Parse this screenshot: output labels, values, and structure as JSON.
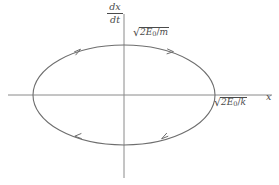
{
  "figure": {
    "name": "phase-space-ellipse-diagram",
    "background_color": "#ffffff",
    "line_color": "#6e6e6e",
    "text_color": "#4a4a4a",
    "width": 279,
    "height": 185
  },
  "axes": {
    "vertical": {
      "label_numerator": "dx",
      "label_denominator": "dt",
      "x_position": 124,
      "y_top": 14,
      "y_bottom": 178
    },
    "horizontal": {
      "label": "x",
      "y_position": 95,
      "x_left": 8,
      "x_right": 272
    }
  },
  "labels": {
    "vertical_intercept": {
      "radical_sign": "√",
      "numerator": "2E",
      "subscript": "0",
      "slash": "/",
      "denominator": "m",
      "full_text": "√(2E₀/m)"
    },
    "horizontal_intercept": {
      "radical_sign": "√",
      "numerator": "2E",
      "subscript": "0",
      "slash": "/",
      "denominator": "k",
      "full_text": "√(2E₀/k)"
    },
    "x_axis_name": "x"
  },
  "ellipse": {
    "center_x": 124,
    "center_y": 95,
    "semi_axis_x": 91,
    "semi_axis_y": 50,
    "stroke_color": "#6e6e6e",
    "stroke_width": 1
  },
  "direction_arrows": {
    "orientation": "clockwise",
    "count": 4,
    "markers": [
      {
        "name": "arrow-upper-left",
        "direction": "right"
      },
      {
        "name": "arrow-upper-right",
        "direction": "right"
      },
      {
        "name": "arrow-lower-right",
        "direction": "left"
      },
      {
        "name": "arrow-lower-left",
        "direction": "left"
      }
    ]
  }
}
